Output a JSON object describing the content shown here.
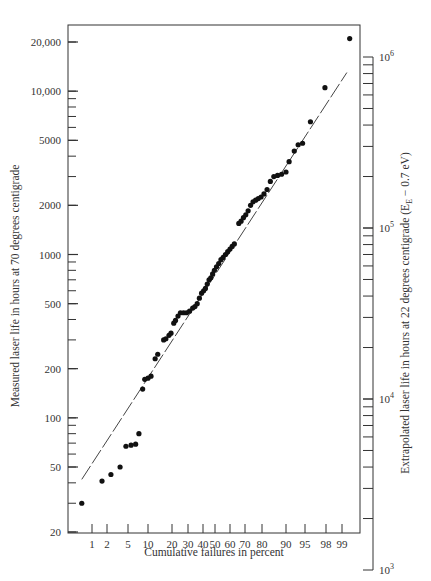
{
  "chart_data": {
    "type": "scatter",
    "title": "",
    "xlabel": "Cumulative failures in percent",
    "ylabel": "Measured laser life in hours at 70 degrees centigrade",
    "y2label": "Extrapolated laser life in hours at 22 degrees centigrade (E_E − 0.7 eV)",
    "y2label_parts": {
      "pre": "Extrapolated laser life in hours at 22 degrees centigrade (E",
      "sub": "E",
      "post": " − 0.7 eV)"
    },
    "x_scale": "normal-probability",
    "y_scale": "log",
    "ylim": [
      20,
      25000
    ],
    "y2lim": [
      1000,
      1000000
    ],
    "x_ticks": [
      1,
      2,
      5,
      10,
      20,
      30,
      40,
      50,
      60,
      70,
      80,
      90,
      95,
      98,
      99
    ],
    "x_tick_labels": [
      "1",
      "2",
      "5",
      "10",
      "20",
      "30",
      "40",
      "50",
      "60",
      "70",
      "80",
      "90",
      "95",
      "98",
      "99"
    ],
    "y_tick_labels": [
      {
        "value": 20,
        "label": "20"
      },
      {
        "value": 50,
        "label": "50"
      },
      {
        "value": 100,
        "label": "100"
      },
      {
        "value": 200,
        "label": "200"
      },
      {
        "value": 500,
        "label": "500"
      },
      {
        "value": 1000,
        "label": "1000"
      },
      {
        "value": 2000,
        "label": "2000"
      },
      {
        "value": 5000,
        "label": "5000"
      },
      {
        "value": 10000,
        "label": "10,000"
      },
      {
        "value": 20000,
        "label": "20,000"
      }
    ],
    "y2_tick_labels": [
      {
        "value": 1000,
        "label": "10",
        "exp": "3"
      },
      {
        "value": 10000,
        "label": "10",
        "exp": "4"
      },
      {
        "value": 100000,
        "label": "10",
        "exp": "5"
      },
      {
        "value": 1000000,
        "label": "10",
        "exp": "6"
      }
    ],
    "grid": false,
    "legend": null,
    "fit_line": {
      "style": "dashed",
      "points": [
        {
          "x_pct": 0.6,
          "y": 42
        },
        {
          "x_pct": 99.2,
          "y": 13000
        }
      ]
    },
    "series": [
      {
        "name": "Measured laser life",
        "points": [
          {
            "x_pct": 0.6,
            "y": 30
          },
          {
            "x_pct": 1.6,
            "y": 41
          },
          {
            "x_pct": 2.4,
            "y": 45
          },
          {
            "x_pct": 3.6,
            "y": 50
          },
          {
            "x_pct": 4.6,
            "y": 67
          },
          {
            "x_pct": 5.6,
            "y": 68
          },
          {
            "x_pct": 6.6,
            "y": 69
          },
          {
            "x_pct": 7.4,
            "y": 80
          },
          {
            "x_pct": 8.4,
            "y": 150
          },
          {
            "x_pct": 9.0,
            "y": 172
          },
          {
            "x_pct": 10.0,
            "y": 175
          },
          {
            "x_pct": 11.0,
            "y": 180
          },
          {
            "x_pct": 12.5,
            "y": 230
          },
          {
            "x_pct": 13.5,
            "y": 245
          },
          {
            "x_pct": 16.0,
            "y": 300
          },
          {
            "x_pct": 17.0,
            "y": 305
          },
          {
            "x_pct": 18.5,
            "y": 320
          },
          {
            "x_pct": 19.5,
            "y": 330
          },
          {
            "x_pct": 21.0,
            "y": 380
          },
          {
            "x_pct": 22.0,
            "y": 395
          },
          {
            "x_pct": 23.5,
            "y": 420
          },
          {
            "x_pct": 25.0,
            "y": 440
          },
          {
            "x_pct": 27.0,
            "y": 440
          },
          {
            "x_pct": 29.0,
            "y": 440
          },
          {
            "x_pct": 31.0,
            "y": 450
          },
          {
            "x_pct": 33.0,
            "y": 470
          },
          {
            "x_pct": 34.5,
            "y": 480
          },
          {
            "x_pct": 36.0,
            "y": 500
          },
          {
            "x_pct": 37.5,
            "y": 540
          },
          {
            "x_pct": 39.0,
            "y": 580
          },
          {
            "x_pct": 40.5,
            "y": 600
          },
          {
            "x_pct": 42.0,
            "y": 620
          },
          {
            "x_pct": 43.5,
            "y": 660
          },
          {
            "x_pct": 45.0,
            "y": 700
          },
          {
            "x_pct": 46.5,
            "y": 720
          },
          {
            "x_pct": 48.0,
            "y": 760
          },
          {
            "x_pct": 49.5,
            "y": 800
          },
          {
            "x_pct": 51.0,
            "y": 840
          },
          {
            "x_pct": 52.5,
            "y": 880
          },
          {
            "x_pct": 54.0,
            "y": 930
          },
          {
            "x_pct": 55.5,
            "y": 960
          },
          {
            "x_pct": 57.0,
            "y": 1000
          },
          {
            "x_pct": 58.5,
            "y": 1040
          },
          {
            "x_pct": 60.0,
            "y": 1080
          },
          {
            "x_pct": 61.5,
            "y": 1120
          },
          {
            "x_pct": 63.0,
            "y": 1160
          },
          {
            "x_pct": 66.0,
            "y": 1550
          },
          {
            "x_pct": 67.5,
            "y": 1600
          },
          {
            "x_pct": 69.0,
            "y": 1680
          },
          {
            "x_pct": 70.5,
            "y": 1750
          },
          {
            "x_pct": 72.0,
            "y": 1850
          },
          {
            "x_pct": 73.5,
            "y": 2000
          },
          {
            "x_pct": 75.0,
            "y": 2100
          },
          {
            "x_pct": 76.5,
            "y": 2150
          },
          {
            "x_pct": 78.0,
            "y": 2200
          },
          {
            "x_pct": 79.5,
            "y": 2250
          },
          {
            "x_pct": 81.0,
            "y": 2350
          },
          {
            "x_pct": 82.5,
            "y": 2500
          },
          {
            "x_pct": 84.0,
            "y": 2800
          },
          {
            "x_pct": 85.5,
            "y": 3000
          },
          {
            "x_pct": 87.0,
            "y": 3050
          },
          {
            "x_pct": 88.5,
            "y": 3100
          },
          {
            "x_pct": 90.0,
            "y": 3200
          },
          {
            "x_pct": 91.0,
            "y": 3700
          },
          {
            "x_pct": 92.5,
            "y": 4300
          },
          {
            "x_pct": 93.5,
            "y": 4700
          },
          {
            "x_pct": 94.5,
            "y": 4800
          },
          {
            "x_pct": 96.0,
            "y": 6500
          },
          {
            "x_pct": 97.9,
            "y": 10500
          },
          {
            "x_pct": 99.3,
            "y": 21000
          }
        ]
      }
    ]
  }
}
